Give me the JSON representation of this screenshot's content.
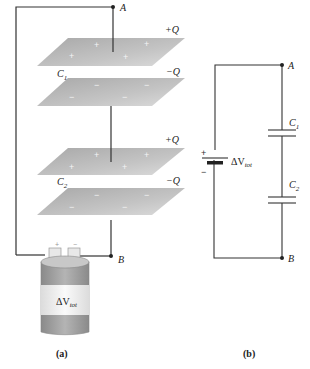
{
  "figure_a": {
    "caption": "(a)",
    "node_a": "A",
    "node_b": "B",
    "capacitor1": {
      "label": "C",
      "sub": "1",
      "top_charge": "+Q",
      "bottom_charge": "−Q"
    },
    "capacitor2": {
      "label": "C",
      "sub": "2",
      "top_charge": "+Q",
      "bottom_charge": "−Q"
    },
    "battery": {
      "label": "ΔV",
      "sub": "tot",
      "pos_terminal": "+",
      "neg_terminal": "−"
    }
  },
  "figure_b": {
    "caption": "(b)",
    "node_a": "A",
    "node_b": "B",
    "capacitor1": {
      "label": "C",
      "sub": "1"
    },
    "capacitor2": {
      "label": "C",
      "sub": "2"
    },
    "battery": {
      "label": "ΔV",
      "sub": "tot",
      "pos_terminal": "+",
      "neg_terminal": "−"
    }
  },
  "colors": {
    "wire": "#333333",
    "plate": "#b8b8b8",
    "battery_band": "#9a9a9a",
    "battery_body": "#f0f0f0"
  }
}
